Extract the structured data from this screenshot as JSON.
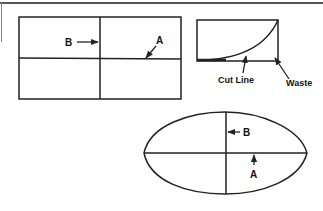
{
  "figures": {
    "rectangle": {
      "labels": {
        "b": "B",
        "a": "A"
      }
    },
    "curve_panel": {
      "labels": {
        "cut_line": "Cut Line",
        "waste": "Waste"
      }
    },
    "ellipse": {
      "labels": {
        "b": "B",
        "a": "A"
      }
    }
  },
  "colors": {
    "line": "#222222",
    "background": "#ffffff"
  }
}
